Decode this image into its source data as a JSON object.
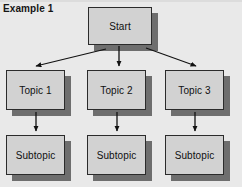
{
  "figure": {
    "caption": "Example 1",
    "background_color": "#e9e9e9",
    "node_fill_color": "#d2d2d2",
    "node_border_color": "#2b2b2b",
    "shadow_color": "#6e6e6e",
    "arrow_color": "#111111"
  },
  "nodes": {
    "start": {
      "label": "Start",
      "x": 88,
      "y": 7,
      "w": 64,
      "h": 38
    },
    "topic1": {
      "label": "Topic 1",
      "x": 6,
      "y": 70,
      "w": 59,
      "h": 40
    },
    "topic2": {
      "label": "Topic 2",
      "x": 87,
      "y": 70,
      "w": 59,
      "h": 40
    },
    "topic3": {
      "label": "Topic 3",
      "x": 165,
      "y": 70,
      "w": 59,
      "h": 40
    },
    "subtopic1": {
      "label": "Subtopic",
      "x": 6,
      "y": 135,
      "w": 59,
      "h": 40
    },
    "subtopic2": {
      "label": "Subtopic",
      "x": 87,
      "y": 135,
      "w": 59,
      "h": 40
    },
    "subtopic3": {
      "label": "Subtopic",
      "x": 165,
      "y": 135,
      "w": 59,
      "h": 40
    }
  },
  "edges": [
    {
      "name": "start-to-topic1",
      "from": "start",
      "to": "topic1",
      "type": "diagonal"
    },
    {
      "name": "start-to-topic2",
      "from": "start",
      "to": "topic2",
      "type": "vertical"
    },
    {
      "name": "start-to-topic3",
      "from": "start",
      "to": "topic3",
      "type": "diagonal"
    },
    {
      "name": "topic1-to-subtopic1",
      "from": "topic1",
      "to": "subtopic1",
      "type": "vertical"
    },
    {
      "name": "topic2-to-subtopic2",
      "from": "topic2",
      "to": "subtopic2",
      "type": "vertical"
    },
    {
      "name": "topic3-to-subtopic3",
      "from": "topic3",
      "to": "subtopic3",
      "type": "vertical"
    }
  ]
}
